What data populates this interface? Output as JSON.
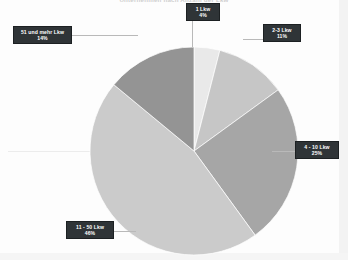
{
  "chart_data": {
    "type": "pie",
    "title": "Unternehmen nach Anzahl der Lkw",
    "xlabel": "",
    "ylabel": "",
    "legend_position": "none",
    "grid": false,
    "value_unit": "%",
    "categories": [
      "1 Lkw",
      "2-3 Lkw",
      "4 - 10 Lkw",
      "11 - 50 Lkw",
      "51 und mehr Lkw"
    ],
    "values": [
      4,
      11,
      25,
      46,
      14
    ],
    "labels": [
      "4%",
      "11%",
      "25%",
      "46%",
      "14%"
    ],
    "colors": [
      "#e9e9e9",
      "#c6c6c6",
      "#a6a6a6",
      "#cbcbcb",
      "#949494"
    ],
    "slices": [
      {
        "name": "1 Lkw",
        "value": 4,
        "label": "4%",
        "color": "#e9e9e9"
      },
      {
        "name": "2-3 Lkw",
        "value": 11,
        "label": "11%",
        "color": "#c6c6c6"
      },
      {
        "name": "4 - 10 Lkw",
        "value": 25,
        "label": "25%",
        "color": "#a6a6a6"
      },
      {
        "name": "11 - 50 Lkw",
        "value": 46,
        "label": "46%",
        "color": "#cbcbcb"
      },
      {
        "name": "51 und mehr Lkw",
        "value": 14,
        "label": "14%",
        "color": "#949494"
      }
    ]
  },
  "callouts": {
    "one": {
      "label": "1 Lkw",
      "pct": "4%"
    },
    "two_three": {
      "label": "2-3 Lkw",
      "pct": "11%"
    },
    "four_ten": {
      "label": "4 - 10 Lkw",
      "pct": "25%"
    },
    "eleven_fifty": {
      "label": "11 - 50 Lkw",
      "pct": "46%"
    },
    "fiftyone_plus": {
      "label": "51 und mehr Lkw",
      "pct": "14%"
    }
  },
  "title": "Unternehmen nach Anzahl der Lkw"
}
